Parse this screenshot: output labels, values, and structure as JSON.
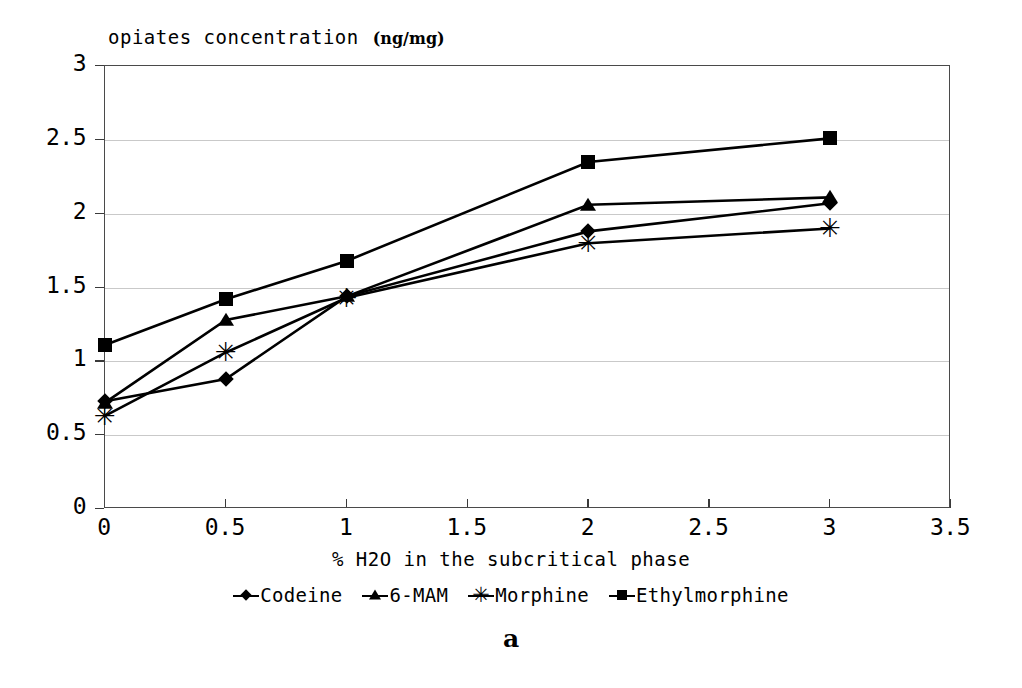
{
  "title": {
    "main": "opiates concentration",
    "unit": "(ng/mg)"
  },
  "caption": "a",
  "chart_data": {
    "type": "line",
    "xlabel": "% H2O in the subcritical phase",
    "ylabel": "opiates concentration (ng/mg)",
    "x": [
      0,
      0.5,
      1,
      2,
      3
    ],
    "xlim": [
      0,
      3.5
    ],
    "ylim": [
      0,
      3
    ],
    "xticks": [
      "0",
      "0.5",
      "1",
      "1.5",
      "2",
      "2.5",
      "3",
      "3.5"
    ],
    "yticks": [
      "0",
      "0.5",
      "1",
      "1.5",
      "2",
      "2.5",
      "3"
    ],
    "grid": "horizontal",
    "legend_position": "below-axis",
    "series": [
      {
        "name": "Codeine",
        "marker": "diamond-icon",
        "values": [
          0.73,
          0.88,
          1.44,
          1.88,
          2.07
        ]
      },
      {
        "name": "6-MAM",
        "marker": "triangle-icon",
        "values": [
          0.72,
          1.28,
          1.44,
          2.06,
          2.11
        ]
      },
      {
        "name": "Morphine",
        "marker": "asterisk-icon",
        "values": [
          0.63,
          1.06,
          1.43,
          1.8,
          1.9
        ]
      },
      {
        "name": "Ethylmorphine",
        "marker": "square-icon",
        "values": [
          1.11,
          1.42,
          1.68,
          2.35,
          2.51
        ]
      }
    ]
  },
  "colors": {
    "series": "#000000",
    "grid": "#c9c9c9",
    "frame": "#4a4a4a",
    "background": "#ffffff"
  }
}
